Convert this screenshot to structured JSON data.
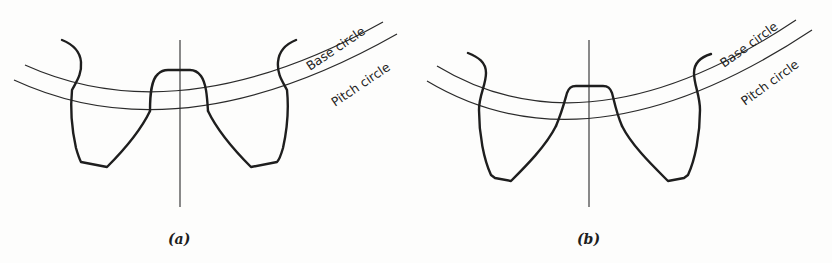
{
  "figure": {
    "panels": [
      {
        "id": "a",
        "caption": "(a)",
        "labels": {
          "base_circle": "Base circle",
          "pitch_circle": "Pitch circle"
        },
        "description": "Gear tooth profile with undercut flanks; tooth tips hooked at addendum"
      },
      {
        "id": "b",
        "caption": "(b)",
        "labels": {
          "base_circle": "Base circle",
          "pitch_circle": "Pitch circle"
        },
        "description": "Gear tooth profile with modified (non-undercut) flanks"
      }
    ],
    "colors": {
      "line": "#1e1e1e",
      "background": "#fdfdfc"
    }
  }
}
